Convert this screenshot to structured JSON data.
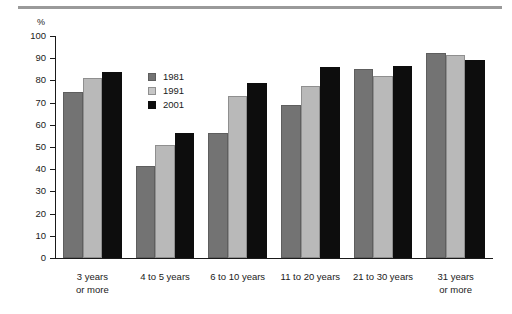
{
  "chart_data": {
    "type": "bar",
    "title": "",
    "subtitle": "",
    "xlabel": "",
    "ylabel": "%",
    "ylim": [
      0,
      100
    ],
    "yticks": [
      0,
      10,
      20,
      30,
      40,
      50,
      60,
      70,
      80,
      90,
      100
    ],
    "grid": false,
    "legend_position": "inside-upper-left",
    "categories": [
      "3 years\nor more",
      "4 to 5 years",
      "6 to 10 years",
      "11 to 20 years",
      "21 to 30 years",
      "31 years\nor more"
    ],
    "category_lines": [
      [
        "3 years",
        "or more"
      ],
      [
        "4 to 5 years",
        ""
      ],
      [
        "6 to 10 years",
        ""
      ],
      [
        "11 to 20 years",
        ""
      ],
      [
        "21 to 30 years",
        ""
      ],
      [
        "31 years",
        "or more"
      ]
    ],
    "series": [
      {
        "name": "1981",
        "color": "#737373",
        "values": [
          75,
          41.5,
          56.5,
          69,
          85,
          92.5
        ]
      },
      {
        "name": "1991",
        "color": "#b9b9b9",
        "values": [
          81,
          51,
          73,
          77.5,
          82,
          91.5
        ]
      },
      {
        "name": "2001",
        "color": "#0d0d0d",
        "values": [
          84,
          56.5,
          79,
          86,
          86.5,
          89
        ]
      }
    ]
  },
  "axis": {
    "unit_label": "%"
  },
  "legend": {
    "items": [
      {
        "label": "1981",
        "swatch": "legend-swatch-1981"
      },
      {
        "label": "1991",
        "swatch": "legend-swatch-1991"
      },
      {
        "label": "2001",
        "swatch": "legend-swatch-2001"
      }
    ]
  }
}
